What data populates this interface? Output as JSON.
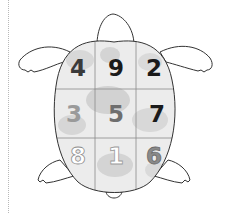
{
  "figure": {
    "grid": {
      "rows": [
        [
          {
            "value": "4",
            "fill": "#3a3a3a",
            "stroke": "none"
          },
          {
            "value": "9",
            "fill": "#1a1a1a",
            "stroke": "none"
          },
          {
            "value": "2",
            "fill": "#1a1a1a",
            "stroke": "none"
          }
        ],
        [
          {
            "value": "3",
            "fill": "#9a9a9a",
            "stroke": "none"
          },
          {
            "value": "5",
            "fill": "#6e6e6e",
            "stroke": "none"
          },
          {
            "value": "7",
            "fill": "#1a1a1a",
            "stroke": "none"
          }
        ],
        [
          {
            "value": "8",
            "fill": "#ffffff",
            "stroke": "#8c8c8c"
          },
          {
            "value": "1",
            "fill": "#ffffff",
            "stroke": "#9a9a9a"
          },
          {
            "value": "6",
            "fill": "#8a8a8a",
            "stroke": "#6a6a6a"
          }
        ]
      ]
    },
    "colors": {
      "outline": "#333333",
      "shell_base": "#ececec",
      "shell_mottle": "#d4d4d4",
      "grid_line": "#8a8a8a"
    }
  }
}
